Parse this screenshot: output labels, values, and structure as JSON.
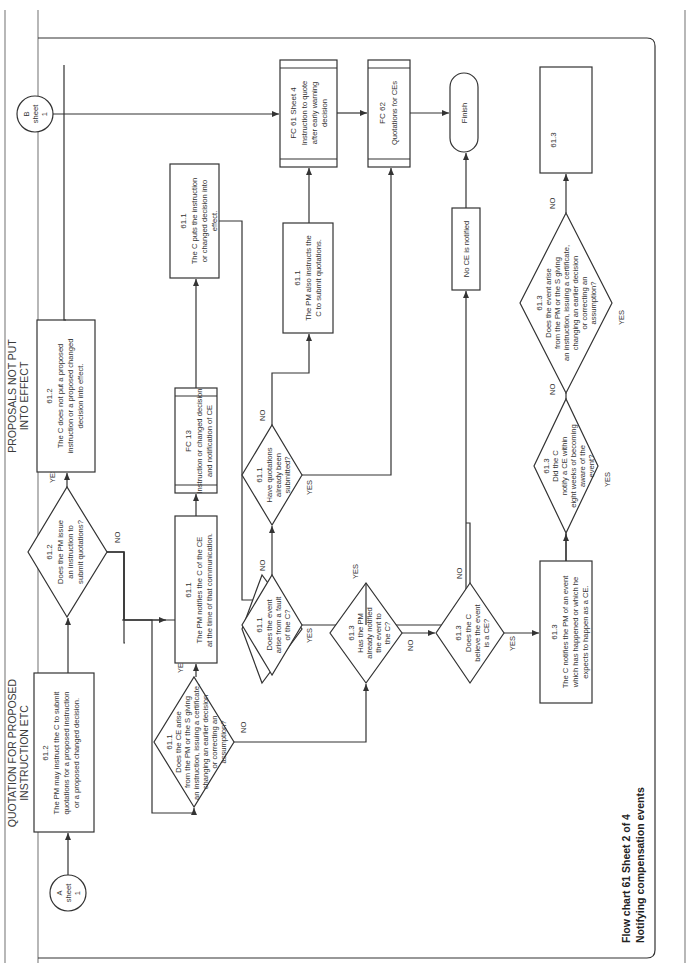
{
  "page": {
    "orientation": "rotated-90-ccw",
    "caption": {
      "line1": "Flow chart 61   Sheet 2 of 4",
      "line2": "Notifying compensation events"
    }
  },
  "connectors": {
    "a": {
      "letter": "A",
      "word": "sheet",
      "num": "1"
    },
    "b": {
      "letter": "B",
      "word": "sheet",
      "num": "1"
    },
    "c": {
      "letter": "C",
      "word": "sheet",
      "num": "3"
    }
  },
  "section_labels": {
    "quotation_proposed": [
      "QUOTATION FOR PROPOSED",
      "INSTRUCTION ETC"
    ],
    "proposals_not_put": [
      "PROPOSALS NOT PUT",
      "INTO EFFECT"
    ],
    "instruction_certificate": [
      "INSTRUCTION,",
      "CERTIFICATE,",
      "CHANGING",
      "DECISION OR",
      "CORRECTING",
      "ASSUMPTION"
    ],
    "pm_instruction": [
      "PROJECT MANAGER'S INSTRUCTION AND NOTIFICATION"
    ],
    "putting_into_effect": [
      "PUTTING INSTRUCTIONS",
      "ETC INTO EFFECT"
    ],
    "contractors_fault": [
      "CONTRACTOR'S",
      "FAULT?"
    ],
    "quotation_already": [
      "QUOTATION",
      "ALREADY",
      "SUBMITTED?"
    ],
    "instruction_to_submit": [
      "INSTRUCTION TO",
      "SUBMIT QUOTATION"
    ],
    "instruction_already_given": [
      "INSTRUCTION",
      "ALREADY",
      "GIVEN?"
    ],
    "not_a_ce": [
      "NOT A",
      "COMPENSATION",
      "EVENT"
    ],
    "quotation_for_ce": [
      "QUOTATION FOR",
      "COMPENSATION",
      "EVENT"
    ],
    "contractor_believes": [
      "CONTRACTOR",
      "BELIEVES",
      "EVENT IS CE?"
    ],
    "contractor_notifies": [
      "CONTRACTOR",
      "NOTIFIES WITHIN",
      "EIGHT WEEKS?"
    ],
    "does_ce_arise": [
      "DOES THE CE ARISE",
      "FROM INSTRUCTION",
      "OR CHANGED DECISION?"
    ],
    "contractor_not_entitled": [
      "CONTRACTOR NOT",
      "ENTITLED TO CHANGES",
      "IN PRICES ETC"
    ]
  },
  "nodes": {
    "box_pm_may_instruct": {
      "ref": "61.2",
      "lines": [
        "The PM may instruct the C to submit",
        "quotations for a proposed instruction",
        "or a proposed changed decision."
      ]
    },
    "dec_pm_issue": {
      "ref": "61.2",
      "lines": [
        "Does the PM issue",
        "an instruction to",
        "submit quotations?"
      ],
      "yes": "YES",
      "no": "NO"
    },
    "box_c_does_not_put": {
      "ref": "61.2",
      "lines": [
        "The C does not put a proposed",
        "instruction or a proposed changed",
        "decision into effect."
      ]
    },
    "dec_ce_arise_pm": {
      "ref": "61.1",
      "lines": [
        "Does the CE arise",
        "from the PM or the S giving",
        "an instruction, issuing a certificate,",
        "changing an earlier decision",
        "or correcting an",
        "assumption?"
      ],
      "yes": "YES",
      "no": "NO"
    },
    "box_pm_notifies": {
      "ref": "61.1",
      "lines": [
        "The PM notifies the C of the CE",
        "at the time of that communication."
      ]
    },
    "fc13": {
      "ref": "FC 13",
      "lines": [
        "Instruction or changed decision",
        "and notification of CE"
      ]
    },
    "box_c_puts": {
      "ref": "61.1",
      "lines": [
        "The C puts the instruction",
        "or changed decision into",
        "effect."
      ]
    },
    "dec_fault": {
      "ref": "61.1",
      "lines": [
        "Does the event",
        "arise from a fault",
        "of the C?"
      ],
      "yes": "YES",
      "no": "NO"
    },
    "dec_quotations_submitted": {
      "ref": "61.1",
      "lines": [
        "Have quotations",
        "already been",
        "submitted?"
      ],
      "yes": "YES",
      "no": "NO"
    },
    "box_pm_also": {
      "ref": "61.1",
      "lines": [
        "The PM also instructs the",
        "C to submit quotations."
      ]
    },
    "fc61": {
      "ref": "FC 61 Sheet 4",
      "lines": [
        "Instruction to quote",
        "after early warning",
        "decision"
      ]
    },
    "fc62": {
      "ref": "FC 62",
      "lines": [
        "Quotations for CEs"
      ]
    },
    "finish": {
      "label": "Finish"
    },
    "dec_pm_already": {
      "ref": "61.3",
      "lines": [
        "Has the PM",
        "already notified",
        "the event to",
        "the C?"
      ],
      "yes": "YES",
      "no": "NO"
    },
    "box_no_ce": {
      "label": "No CE is notified"
    },
    "dec_c_believe": {
      "ref": "61.3",
      "lines": [
        "Does the C",
        "believe the event",
        "is a CE?"
      ],
      "yes": "YES",
      "no": "NO"
    },
    "box_c_notifies": {
      "ref": "61.3",
      "lines": [
        "The C notifies the PM of an event",
        "which has happened or which he",
        "expects to happen as a CE."
      ]
    },
    "dec_eight_weeks": {
      "ref": "61.3",
      "lines": [
        "Did the C",
        "notify a CE within",
        "eight weeks of becoming",
        "aware of the",
        "event?"
      ],
      "yes": "YES",
      "no": "NO"
    },
    "dec_event_arise": {
      "ref": "61.3",
      "lines": [
        "Does the event arise",
        "from the PM or the S giving",
        "an instruction, issuing a certificate,",
        "changing an earlier decision",
        "or correcting an",
        "assumption?"
      ],
      "yes": "YES",
      "no": "NO"
    },
    "box_not_entitled": {
      "ref": "61.3",
      "lines": [
        "The C is not entitled to a",
        "change in the Prices, the",
        "Completion Date or a",
        "Key Date."
      ]
    }
  },
  "colors": {
    "ink": "#333333",
    "rule": "#888888",
    "background": "#ffffff"
  }
}
